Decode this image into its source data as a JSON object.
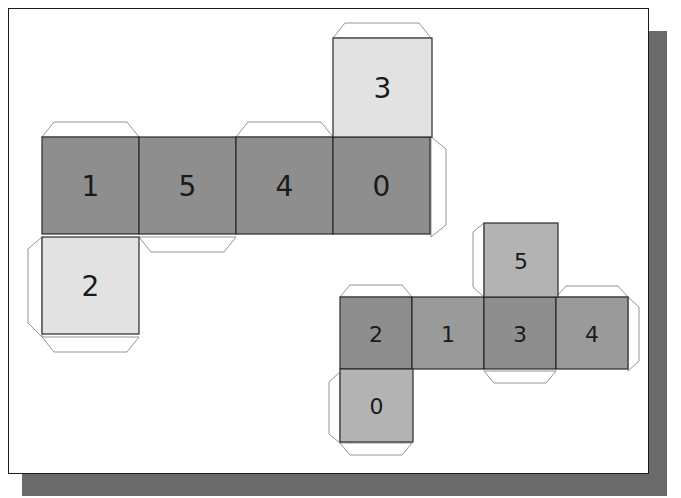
{
  "colors": {
    "dark": "#8e8e8e",
    "medium": "#9a9a9a",
    "light": "#e2e2e2",
    "mid_light": "#b3b3b3",
    "shadow": "#6b6b6b"
  },
  "nets": [
    {
      "name": "net-left",
      "faces": [
        {
          "label": "1",
          "x": 42,
          "y": 137,
          "size": 97,
          "shade": "dark"
        },
        {
          "label": "5",
          "x": 139,
          "y": 137,
          "size": 97,
          "shade": "dark"
        },
        {
          "label": "4",
          "x": 236,
          "y": 137,
          "size": 97,
          "shade": "dark"
        },
        {
          "label": "0",
          "x": 333,
          "y": 137,
          "size": 97,
          "shade": "dark"
        },
        {
          "label": "3",
          "x": 333,
          "y": 38,
          "size": 99,
          "shade": "light"
        },
        {
          "label": "2",
          "x": 42,
          "y": 237,
          "size": 97,
          "shade": "light"
        }
      ]
    },
    {
      "name": "net-right",
      "faces": [
        {
          "label": "2",
          "x": 340,
          "y": 297,
          "size": 72,
          "shade": "dark"
        },
        {
          "label": "1",
          "x": 412,
          "y": 297,
          "size": 72,
          "shade": "medium"
        },
        {
          "label": "3",
          "x": 484,
          "y": 297,
          "size": 72,
          "shade": "dark"
        },
        {
          "label": "4",
          "x": 556,
          "y": 297,
          "size": 72,
          "shade": "medium"
        },
        {
          "label": "5",
          "x": 484,
          "y": 223,
          "size": 74,
          "shade": "mid_light"
        },
        {
          "label": "0",
          "x": 340,
          "y": 369,
          "size": 73,
          "shade": "mid_light"
        }
      ]
    }
  ]
}
